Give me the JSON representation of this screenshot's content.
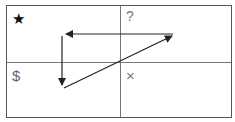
{
  "diagram": {
    "type": "growth-share-matrix",
    "quadrants": [
      {
        "position": "top-left",
        "symbol": "★",
        "meaning": "star"
      },
      {
        "position": "top-right",
        "symbol": "?",
        "meaning": "question-mark"
      },
      {
        "position": "bottom-left",
        "symbol": "$",
        "meaning": "cash-cow"
      },
      {
        "position": "bottom-right",
        "symbol": "×",
        "meaning": "dog"
      }
    ],
    "arrows": [
      {
        "from": "top-right",
        "to": "top-left",
        "direction": "left"
      },
      {
        "from": "top-left",
        "to": "bottom-left",
        "direction": "down"
      },
      {
        "from": "bottom-left",
        "to": "top-right",
        "direction": "diagonal-up-right"
      }
    ],
    "colors": {
      "border": "#555555",
      "divider": "#777777",
      "arrow": "#222222",
      "star": "#111111",
      "symbol": "#777777"
    }
  }
}
